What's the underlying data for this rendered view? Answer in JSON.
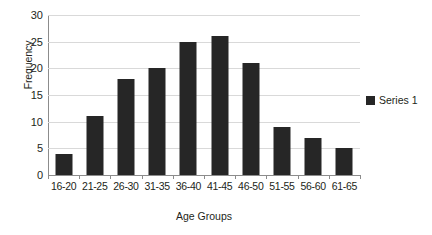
{
  "chart_data": {
    "type": "bar",
    "title": "",
    "categories": [
      "16-20",
      "21-25",
      "26-30",
      "31-35",
      "36-40",
      "41-45",
      "46-50",
      "51-55",
      "56-60",
      "61-65"
    ],
    "values": [
      4,
      11,
      18,
      20,
      25,
      26,
      21,
      9,
      7,
      5
    ],
    "series": [
      {
        "name": "Series 1",
        "values": [
          4,
          11,
          18,
          20,
          25,
          26,
          21,
          9,
          7,
          5
        ]
      }
    ],
    "xlabel": "Age Groups",
    "ylabel": "Frequency",
    "ylim": [
      0,
      30
    ],
    "yticks": [
      0,
      5,
      10,
      15,
      20,
      25,
      30
    ],
    "ytick_labels": [
      "0",
      "5",
      "10",
      "15",
      "20",
      "25",
      "30"
    ],
    "grid": true,
    "legend_position": "right",
    "legend_entries": [
      "Series 1"
    ],
    "colors": {
      "bar": "#262626",
      "gridline": "#d9d9d9",
      "axis": "#8c8c8c",
      "background": "#ffffff",
      "text": "#231f20"
    }
  }
}
